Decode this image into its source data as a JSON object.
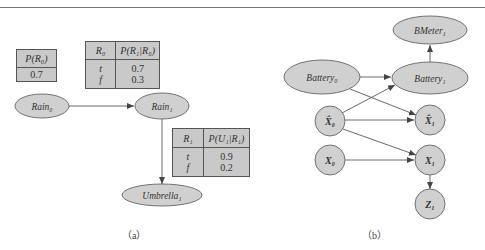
{
  "figure_a": {
    "caption": "（a）",
    "prior_table": {
      "header": "P(R₀)",
      "value": "0.7"
    },
    "transition_table": {
      "headers": [
        "R₀",
        "P(R₁|R₀)"
      ],
      "rows": [
        {
          "cond": "t",
          "prob": "0.7"
        },
        {
          "cond": "f",
          "prob": "0.3"
        }
      ]
    },
    "sensor_table": {
      "headers": [
        "R₁",
        "P(U₁|R₁)"
      ],
      "rows": [
        {
          "cond": "t",
          "prob": "0.9"
        },
        {
          "cond": "f",
          "prob": "0.2"
        }
      ]
    },
    "nodes": {
      "rain0": "Rain₀",
      "rain1": "Rain₁",
      "umbrella1": "Umbrella₁"
    }
  },
  "figure_b": {
    "caption": "（b）",
    "nodes": {
      "bmeter1": "BMeter₁",
      "battery0": "Battery₀",
      "battery1": "Battery₁",
      "xhat0": "X̂₀",
      "xhat1": "X̂₁",
      "x0": "X₀",
      "x1": "X₁",
      "z1": "Z₁"
    }
  },
  "colors": {
    "node_fill": "#d0d0d0",
    "node_stroke": "#555555",
    "table_fill": "#c9c9c9",
    "edge": "#444444"
  }
}
